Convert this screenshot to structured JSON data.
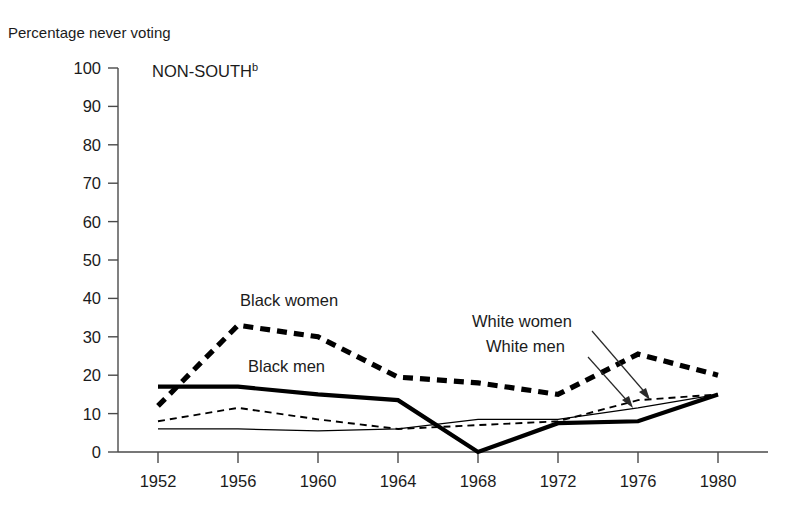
{
  "chart_data": {
    "type": "line",
    "title": "Percentage never voting",
    "panel_label": "NON-SOUTH",
    "panel_label_superscript": "b",
    "xlabel": "",
    "ylabel": "Percentage never voting",
    "categories": [
      "1952",
      "1956",
      "1960",
      "1964",
      "1968",
      "1972",
      "1976",
      "1980"
    ],
    "x": [
      1952,
      1956,
      1960,
      1964,
      1968,
      1972,
      1976,
      1980
    ],
    "ylim": [
      0,
      100
    ],
    "yticks": [
      "0",
      "10",
      "20",
      "30",
      "40",
      "50",
      "60",
      "70",
      "80",
      "90",
      "100"
    ],
    "grid": false,
    "legend": "inline-annotations",
    "series": [
      {
        "name": "Black women",
        "style": "thick-dashed",
        "color": "#000000",
        "values": [
          12,
          33,
          30,
          19.5,
          18,
          15,
          25.5,
          20
        ]
      },
      {
        "name": "Black men",
        "style": "thick-solid",
        "color": "#000000",
        "values": [
          17,
          17,
          15,
          13.5,
          0,
          7.5,
          8,
          15
        ]
      },
      {
        "name": "White women",
        "style": "thin-dashed",
        "color": "#000000",
        "values": [
          8,
          11.5,
          8.5,
          6,
          7,
          8,
          13.5,
          15
        ]
      },
      {
        "name": "White men",
        "style": "thin-solid",
        "color": "#000000",
        "values": [
          6,
          6,
          5.5,
          6,
          8.5,
          8.5,
          11.5,
          15
        ]
      }
    ],
    "annotations": [
      {
        "name": "black-women-label",
        "text": "Black women"
      },
      {
        "name": "black-men-label",
        "text": "Black men"
      },
      {
        "name": "white-women-label",
        "text": "White women"
      },
      {
        "name": "white-men-label",
        "text": "White men"
      }
    ]
  }
}
